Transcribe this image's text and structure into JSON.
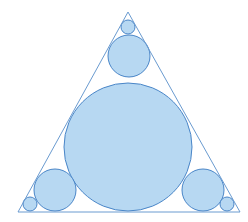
{
  "figure": {
    "top_text_fragment": "",
    "colors": {
      "fill": "#b7d8f2",
      "stroke": "#4a86c8",
      "triangle_stroke": "#6a9bd0",
      "background": "#ffffff"
    },
    "triangle": {
      "apex": [
        128,
        12
      ],
      "base_left": [
        18,
        212
      ],
      "base_right": [
        240,
        212
      ]
    },
    "circles": [
      {
        "name": "incircle-large",
        "cx": 128,
        "cy": 147,
        "r": 64
      },
      {
        "name": "top-medium",
        "cx": 129,
        "cy": 56,
        "r": 21
      },
      {
        "name": "top-small",
        "cx": 128,
        "cy": 27,
        "r": 7
      },
      {
        "name": "bottom-left-medium",
        "cx": 55,
        "cy": 190,
        "r": 21
      },
      {
        "name": "bottom-right-medium",
        "cx": 203,
        "cy": 190,
        "r": 21
      },
      {
        "name": "bottom-left-small",
        "cx": 30,
        "cy": 204,
        "r": 7
      },
      {
        "name": "bottom-right-small",
        "cx": 227,
        "cy": 204,
        "r": 7
      }
    ]
  }
}
